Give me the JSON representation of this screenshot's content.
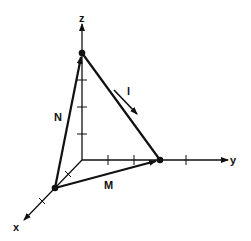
{
  "diagram": {
    "type": "3d-vector-triangle",
    "axes": {
      "x": {
        "label": "x"
      },
      "y": {
        "label": "y"
      },
      "z": {
        "label": "z"
      }
    },
    "vectors": {
      "N": {
        "label": "N",
        "from": "x-axis point",
        "to": "z-axis point"
      },
      "M": {
        "label": "M",
        "from": "x-axis point",
        "to": "y-axis point"
      },
      "l": {
        "label": "l",
        "direction": "from z-axis point toward y-axis point"
      }
    },
    "points": [
      "point on z-axis",
      "point on y-axis",
      "point on x-axis"
    ],
    "colors": {
      "ink": "#111111",
      "background": "#ffffff"
    }
  }
}
